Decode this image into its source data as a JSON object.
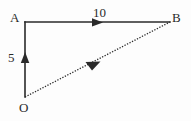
{
  "diagram": {
    "type": "vector-triangle",
    "background_color": "#fdfdfd",
    "stroke_color": "#2a2a2a",
    "vertices": [
      {
        "id": "A",
        "label": "A",
        "x": 25,
        "y": 22
      },
      {
        "id": "B",
        "label": "B",
        "x": 170,
        "y": 22
      },
      {
        "id": "O",
        "label": "O",
        "x": 25,
        "y": 97
      }
    ],
    "edges": [
      {
        "id": "AB",
        "from": "A",
        "to": "B",
        "style": "solid",
        "arrow": "mid-forward",
        "label": "10"
      },
      {
        "id": "OA",
        "from": "O",
        "to": "A",
        "style": "solid",
        "arrow": "mid-forward",
        "label": "5"
      },
      {
        "id": "OB",
        "from": "O",
        "to": "B",
        "style": "dotted",
        "arrow": "mid-forward",
        "label": ""
      }
    ],
    "labels": {
      "vertex_a": "A",
      "vertex_b": "B",
      "vertex_o": "O",
      "length_top": "10",
      "length_left": "5"
    }
  }
}
